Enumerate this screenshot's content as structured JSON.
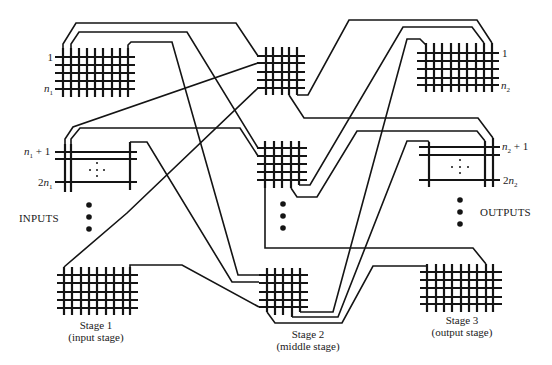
{
  "diagram": {
    "stages": [
      {
        "id": "stage1",
        "label": "Stage 1",
        "sublabel": "(input stage)"
      },
      {
        "id": "stage2",
        "label": "Stage 2",
        "sublabel": "(middle stage)"
      },
      {
        "id": "stage3",
        "label": "Stage 3",
        "sublabel": "(output stage)"
      }
    ],
    "side_labels": {
      "inputs": "INPUTS",
      "outputs": "OUTPUTS"
    },
    "port_labels": {
      "in1_first": {
        "pre": "1"
      },
      "in1_last": {
        "var": "n",
        "sub": "1"
      },
      "in2_first": {
        "var": "n",
        "sub": "1",
        "post": " + 1"
      },
      "in2_last": {
        "pre": "2",
        "var": "n",
        "sub": "1"
      },
      "out1_first": {
        "pre": "1"
      },
      "out1_last": {
        "var": "n",
        "sub": "2"
      },
      "out2_first": {
        "var": "n",
        "sub": "2",
        "post": " + 1"
      },
      "out2_last": {
        "pre": "2",
        "var": "n",
        "sub": "2"
      }
    },
    "switches": [
      {
        "id": "s1a",
        "stage": 1,
        "rows": 5,
        "cols": 9,
        "abbreviated": false
      },
      {
        "id": "s1b",
        "stage": 1,
        "rows": 3,
        "cols": 3,
        "abbreviated": true
      },
      {
        "id": "s1c",
        "stage": 1,
        "rows": 5,
        "cols": 9,
        "abbreviated": false
      },
      {
        "id": "m1",
        "stage": 2,
        "rows": 5,
        "cols": 5,
        "abbreviated": false
      },
      {
        "id": "m2",
        "stage": 2,
        "rows": 5,
        "cols": 5,
        "abbreviated": false
      },
      {
        "id": "m3",
        "stage": 2,
        "rows": 5,
        "cols": 5,
        "abbreviated": false
      },
      {
        "id": "s3a",
        "stage": 3,
        "rows": 5,
        "cols": 9,
        "abbreviated": false
      },
      {
        "id": "s3b",
        "stage": 3,
        "rows": 3,
        "cols": 3,
        "abbreviated": true
      },
      {
        "id": "s3c",
        "stage": 3,
        "rows": 5,
        "cols": 9,
        "abbreviated": false
      }
    ],
    "links": [
      {
        "from": "s1a",
        "from_col": 1,
        "to": "m1",
        "to_row": 1
      },
      {
        "from": "s1a",
        "from_col": 2,
        "to": "m2",
        "to_row": 1
      },
      {
        "from": "s1a",
        "from_col": 9,
        "to": "m3",
        "to_row": 1
      },
      {
        "from": "s1b",
        "from_col": 1,
        "to": "m1",
        "to_row": 2
      },
      {
        "from": "s1b",
        "from_col": 2,
        "to": "m2",
        "to_row": 2
      },
      {
        "from": "s1b",
        "from_col": 3,
        "to": "m3",
        "to_row": 2
      },
      {
        "from": "s1c",
        "from_col": 1,
        "to": "m1",
        "to_row": 5
      },
      {
        "from": "s1c",
        "from_col": 9,
        "to": "m3",
        "to_row": 5
      },
      {
        "from": "m1",
        "from_col": 5,
        "to": "s3a",
        "to_col": 9
      },
      {
        "from": "m1",
        "from_col": 4,
        "to": "s3b",
        "to_col": 3
      },
      {
        "from": "m2",
        "from_col": 5,
        "to": "s3a",
        "to_col": 8
      },
      {
        "from": "m2",
        "from_col": 4,
        "to": "s3b",
        "to_col": 2
      },
      {
        "from": "m2",
        "from_col": 1,
        "to": "s3c",
        "to_col": 8
      },
      {
        "from": "m3",
        "from_col": 5,
        "to": "s3a",
        "to_col": 1
      },
      {
        "from": "m3",
        "from_col": 4,
        "to": "s3b",
        "to_col": 1
      },
      {
        "from": "m3",
        "from_col": 1,
        "to": "s3c",
        "to_col": 1
      }
    ]
  }
}
